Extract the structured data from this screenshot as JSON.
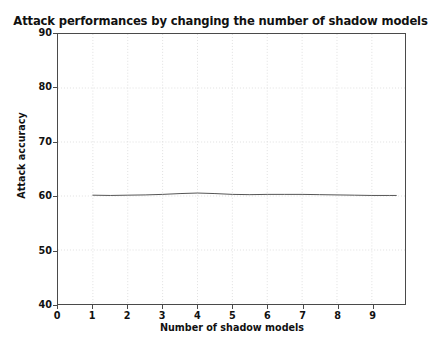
{
  "chart_data": {
    "type": "line",
    "title": "Attack performances by changing the number of shadow models",
    "xlabel": "Number of shadow models",
    "ylabel": "Attack accuracy",
    "xlim": [
      0,
      9.95
    ],
    "ylim": [
      40,
      90
    ],
    "xticks": [
      0,
      1,
      2,
      3,
      4,
      5,
      6,
      7,
      8,
      9
    ],
    "xtick_labels": [
      "0",
      "1",
      "2",
      "3",
      "4",
      "5",
      "6",
      "7",
      "8",
      "9"
    ],
    "yticks": [
      40,
      50,
      60,
      70,
      80,
      90
    ],
    "ytick_labels": [
      "40",
      "50",
      "60",
      "70",
      "80",
      "90"
    ],
    "grid": true,
    "grid_style": "dotted",
    "grid_color": "#d8d8d8",
    "legend": null,
    "line_color": "#555555",
    "line_width": 1.0,
    "series": [
      {
        "name": "attack accuracy",
        "x": [
          1.0,
          1.5,
          2.0,
          2.5,
          3.0,
          3.5,
          4.0,
          4.5,
          5.0,
          5.5,
          6.0,
          6.5,
          7.0,
          7.5,
          8.0,
          8.5,
          9.0,
          9.5,
          9.7
        ],
        "values": [
          60.15,
          60.1,
          60.15,
          60.2,
          60.3,
          60.45,
          60.55,
          60.45,
          60.3,
          60.25,
          60.3,
          60.3,
          60.3,
          60.25,
          60.2,
          60.15,
          60.1,
          60.1,
          60.1
        ]
      }
    ]
  },
  "figure": {
    "background_color": "#ffffff",
    "axes_color": "#4a4a4a"
  }
}
